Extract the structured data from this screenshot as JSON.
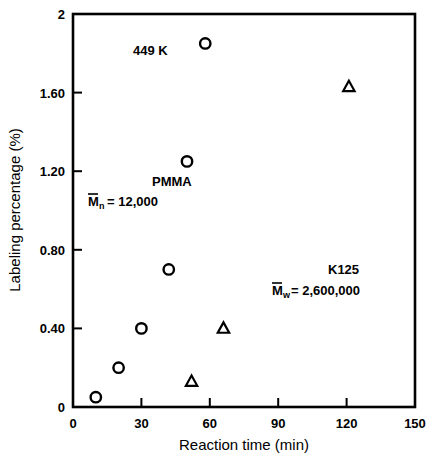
{
  "chart_data": {
    "type": "scatter",
    "title": "",
    "xlabel": "Reaction time (min)",
    "ylabel": "Labeling percentage (%)",
    "xlim": [
      0,
      150
    ],
    "ylim": [
      0,
      2
    ],
    "grid": false,
    "legend_position": "none",
    "xticks": [
      "0",
      "30",
      "60",
      "90",
      "120",
      "150"
    ],
    "xtick_values": [
      0,
      30,
      60,
      90,
      120,
      150
    ],
    "yticks": [
      "0",
      "0.40",
      "0.80",
      "1.20",
      "1.60",
      "2"
    ],
    "ytick_values": [
      0,
      0.4,
      0.8,
      1.2,
      1.6,
      2
    ],
    "series": [
      {
        "name": "PMMA",
        "marker": "circle",
        "points": [
          {
            "x": 10,
            "y": 0.05
          },
          {
            "x": 20,
            "y": 0.2
          },
          {
            "x": 30,
            "y": 0.4
          },
          {
            "x": 42,
            "y": 0.7
          },
          {
            "x": 50,
            "y": 1.25
          },
          {
            "x": 58,
            "y": 1.85
          }
        ]
      },
      {
        "name": "K125",
        "marker": "triangle",
        "points": [
          {
            "x": 52,
            "y": 0.13
          },
          {
            "x": 66,
            "y": 0.4
          },
          {
            "x": 121,
            "y": 1.63
          }
        ]
      }
    ],
    "annotations": [
      {
        "id": "temperature",
        "text": "449 K",
        "x": 35,
        "y": 1.79
      },
      {
        "id": "pmma-label",
        "text": "PMMA",
        "x": 35,
        "y": 1.11
      },
      {
        "id": "pmma-mn-symbol",
        "text": "M",
        "sub": "n",
        "rest": "=  12,000",
        "x": 16,
        "y": 1.0
      },
      {
        "id": "k125-label",
        "text": "K125",
        "x": 103,
        "y": 0.72
      },
      {
        "id": "k125-mw-symbol",
        "text": "M",
        "sub": "w",
        "rest": "=  2,600,000",
        "x": 86,
        "y": 0.62
      }
    ]
  },
  "annotation_text": {
    "temperature": "449 K",
    "pmma_name": "PMMA",
    "pmma_mn_base": "M",
    "pmma_mn_sub": "n",
    "pmma_mn_value": "=  12,000",
    "k125_name": "K125",
    "k125_mw_base": "M",
    "k125_mw_sub": "w",
    "k125_mw_value": "=  2,600,000"
  },
  "axis_titles": {
    "x": "Reaction time (min)",
    "y": "Labeling percentage (%)"
  },
  "colors": {
    "ink": "#000000",
    "background": "#ffffff"
  }
}
